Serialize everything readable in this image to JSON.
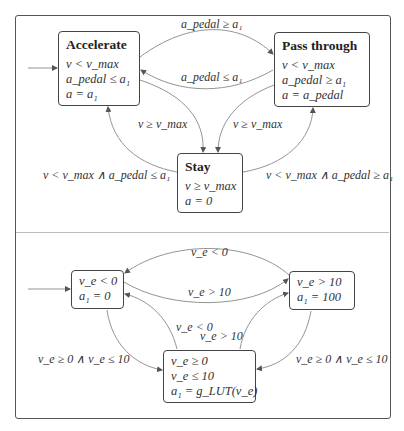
{
  "top_diagram": {
    "states": [
      {
        "id": "accelerate",
        "title": "Accelerate",
        "conditions": [
          "v < v_max",
          "a_pedal ≤ a₁",
          "a = a₁"
        ],
        "initial": true
      },
      {
        "id": "pass_through",
        "title": "Pass through",
        "conditions": [
          "v < v_max",
          "a_pedal ≥ a₁",
          "a = a_pedal"
        ],
        "initial": false
      },
      {
        "id": "stay",
        "title": "Stay",
        "conditions": [
          "v ≥ v_max",
          "a = 0"
        ],
        "initial": false
      }
    ],
    "transitions": [
      {
        "from": "accelerate",
        "to": "pass_through",
        "label": "a_pedal ≥ a₁"
      },
      {
        "from": "pass_through",
        "to": "accelerate",
        "label": "a_pedal ≤ a₁"
      },
      {
        "from": "accelerate",
        "to": "stay",
        "label": "v ≥ v_max"
      },
      {
        "from": "pass_through",
        "to": "stay",
        "label": "v ≥ v_max"
      },
      {
        "from": "stay",
        "to": "accelerate",
        "label": "v < v_max ∧ a_pedal ≤ a₁"
      },
      {
        "from": "stay",
        "to": "pass_through",
        "label": "v < v_max ∧ a_pedal ≥ a₁"
      }
    ]
  },
  "bottom_diagram": {
    "states": [
      {
        "id": "negative",
        "conditions": [
          "v_e < 0",
          "a₁ = 0"
        ],
        "initial": true
      },
      {
        "id": "high",
        "conditions": [
          "v_e > 10",
          "a₁ = 100"
        ],
        "initial": false
      },
      {
        "id": "lut",
        "conditions": [
          "v_e ≥ 0",
          "v_e ≤ 10",
          "a₁ = g_LUT(v_e)"
        ],
        "initial": false
      }
    ],
    "transitions": [
      {
        "from": "high",
        "to": "negative",
        "label": "v_e < 0"
      },
      {
        "from": "negative",
        "to": "high",
        "label": "v_e > 10"
      },
      {
        "from": "lut",
        "to": "negative",
        "label": "v_e < 0"
      },
      {
        "from": "lut",
        "to": "high",
        "label": "v_e > 10"
      },
      {
        "from": "negative",
        "to": "lut",
        "label": "v_e ≥ 0 ∧ v_e ≤ 10"
      },
      {
        "from": "high",
        "to": "lut",
        "label": "v_e ≥ 0 ∧ v_e ≤ 10"
      }
    ]
  }
}
